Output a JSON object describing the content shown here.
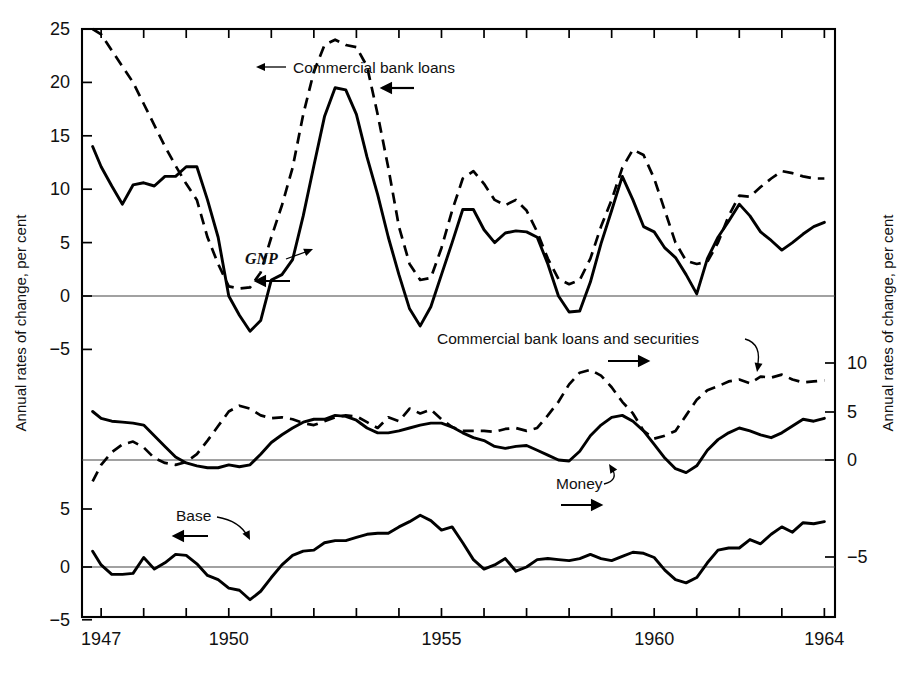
{
  "figure": {
    "left_axis_title": "Annual rates of change, per cent",
    "right_axis_title": "Annual rates of change, per cent"
  },
  "axes": {
    "left_top_ticks": [
      "25",
      "20",
      "15",
      "10",
      "5",
      "0",
      "-5"
    ],
    "left_middle_ticks": [
      "5"
    ],
    "left_bottom_ticks": [
      "5",
      "0",
      "-5"
    ],
    "right_ticks": [
      "10",
      "5",
      "0",
      "-5"
    ],
    "x_labels": [
      "1947",
      "1950",
      "1955",
      "1960",
      "1964"
    ]
  },
  "annotations": {
    "commercial_bank_loans": "Commercial bank loans",
    "gnp": "GNP",
    "commercial_bank_loans_and_securities": "Commercial bank loans and securities",
    "money": "Money",
    "base": "Base"
  },
  "chart_data": {
    "type": "line",
    "title": "",
    "xlabel": "",
    "ylabel": "Annual rates of change, per cent",
    "grid": false,
    "legend": "inline annotations with leader arrows",
    "panels": [
      {
        "name": "top",
        "ylim": [
          -5,
          25
        ],
        "yticks": [
          -5,
          0,
          5,
          10,
          15,
          20,
          25
        ],
        "axis_side": "left",
        "series": [
          {
            "name": "GNP",
            "style": "solid",
            "arrow": "left",
            "x": [
              1946.8,
              1947.0,
              1947.25,
              1947.5,
              1947.75,
              1948.0,
              1948.25,
              1948.5,
              1948.75,
              1949.0,
              1949.25,
              1949.5,
              1949.75,
              1950.0,
              1950.25,
              1950.5,
              1950.75,
              1951.0,
              1951.25,
              1951.5,
              1951.75,
              1952.0,
              1952.25,
              1952.5,
              1952.75,
              1953.0,
              1953.25,
              1953.5,
              1953.75,
              1954.0,
              1954.25,
              1954.5,
              1954.75,
              1955.0,
              1955.25,
              1955.5,
              1955.75,
              1956.0,
              1956.25,
              1956.5,
              1956.75,
              1957.0,
              1957.25,
              1957.5,
              1957.75,
              1958.0,
              1958.25,
              1958.5,
              1958.75,
              1959.0,
              1959.25,
              1959.5,
              1959.75,
              1960.0,
              1960.25,
              1960.5,
              1960.75,
              1961.0,
              1961.25,
              1961.5,
              1961.75,
              1962.0,
              1962.25,
              1962.5,
              1962.75,
              1963.0,
              1963.25,
              1963.5,
              1963.75,
              1964.0
            ],
            "y": [
              14.0,
              12.1,
              10.3,
              8.6,
              10.4,
              10.6,
              10.3,
              11.2,
              11.2,
              12.1,
              12.1,
              9.0,
              5.5,
              0.0,
              -1.8,
              -3.3,
              -2.3,
              1.5,
              2.0,
              3.4,
              7.5,
              12.2,
              16.8,
              19.5,
              19.3,
              17.0,
              13.0,
              9.5,
              5.5,
              2.0,
              -1.2,
              -2.8,
              -1.0,
              2.0,
              5.0,
              8.1,
              8.1,
              6.2,
              5.0,
              5.9,
              6.1,
              6.0,
              5.5,
              3.0,
              0.0,
              -1.5,
              -1.4,
              1.3,
              4.9,
              8.0,
              11.2,
              9.0,
              6.5,
              6.0,
              4.5,
              3.6,
              2.0,
              0.2,
              3.5,
              5.5,
              7.0,
              8.6,
              7.5,
              6.0,
              5.2,
              4.3,
              5.0,
              5.8,
              6.5,
              6.9
            ]
          },
          {
            "name": "Commercial bank loans",
            "style": "dashed",
            "arrow": "left",
            "x": [
              1946.8,
              1947.0,
              1947.25,
              1947.5,
              1947.75,
              1948.0,
              1948.25,
              1948.5,
              1948.75,
              1949.0,
              1949.25,
              1949.5,
              1949.75,
              1950.0,
              1950.25,
              1950.5,
              1950.75,
              1951.0,
              1951.25,
              1951.5,
              1951.75,
              1952.0,
              1952.25,
              1952.5,
              1952.75,
              1953.0,
              1953.25,
              1953.5,
              1953.75,
              1954.0,
              1954.25,
              1954.5,
              1954.75,
              1955.0,
              1955.25,
              1955.5,
              1955.75,
              1956.0,
              1956.25,
              1956.5,
              1956.75,
              1957.0,
              1957.25,
              1957.5,
              1957.75,
              1958.0,
              1958.25,
              1958.5,
              1958.75,
              1959.0,
              1959.25,
              1959.5,
              1959.75,
              1960.0,
              1960.25,
              1960.5,
              1960.75,
              1961.0,
              1961.25,
              1961.5,
              1961.75,
              1962.0,
              1962.25,
              1962.5,
              1962.75,
              1963.0,
              1963.25,
              1963.5,
              1963.75,
              1964.0
            ],
            "y": [
              25.0,
              24.5,
              23.0,
              21.5,
              20.0,
              18.0,
              16.0,
              14.0,
              12.2,
              10.5,
              9.0,
              5.5,
              3.0,
              0.9,
              0.7,
              0.8,
              2.2,
              5.5,
              8.5,
              12.0,
              17.0,
              21.0,
              23.5,
              24.0,
              23.5,
              23.3,
              21.5,
              17.0,
              12.0,
              6.5,
              3.0,
              1.5,
              1.7,
              4.5,
              8.0,
              11.0,
              11.7,
              10.5,
              9.0,
              8.5,
              9.0,
              8.0,
              6.0,
              3.5,
              1.6,
              1.1,
              1.5,
              3.5,
              6.5,
              9.0,
              12.0,
              13.7,
              13.2,
              11.0,
              8.0,
              5.0,
              3.3,
              3.0,
              3.2,
              5.0,
              7.5,
              9.4,
              9.3,
              10.2,
              11.0,
              11.7,
              11.5,
              11.2,
              11.0,
              11.0
            ]
          }
        ]
      },
      {
        "name": "middle",
        "ylim": [
          -3,
          12
        ],
        "yticks": [
          0,
          5,
          10
        ],
        "axis_side": "right",
        "series": [
          {
            "name": "Money",
            "style": "solid",
            "arrow": "right",
            "x": [
              1946.8,
              1947.0,
              1947.25,
              1947.5,
              1947.75,
              1948.0,
              1948.25,
              1948.5,
              1948.75,
              1949.0,
              1949.25,
              1949.5,
              1949.75,
              1950.0,
              1950.25,
              1950.5,
              1950.75,
              1951.0,
              1951.25,
              1951.5,
              1951.75,
              1952.0,
              1952.25,
              1952.5,
              1952.75,
              1953.0,
              1953.25,
              1953.5,
              1953.75,
              1954.0,
              1954.25,
              1954.5,
              1954.75,
              1955.0,
              1955.25,
              1955.5,
              1955.75,
              1956.0,
              1956.25,
              1956.5,
              1956.75,
              1957.0,
              1957.25,
              1957.5,
              1957.75,
              1958.0,
              1958.25,
              1958.5,
              1958.75,
              1959.0,
              1959.25,
              1959.5,
              1959.75,
              1960.0,
              1960.25,
              1960.5,
              1960.75,
              1961.0,
              1961.25,
              1961.5,
              1961.75,
              1962.0,
              1962.25,
              1962.5,
              1962.75,
              1963.0,
              1963.25,
              1963.5,
              1963.75,
              1964.0
            ],
            "y": [
              5.0,
              4.3,
              4.0,
              3.9,
              3.8,
              3.6,
              2.5,
              1.4,
              0.3,
              -0.3,
              -0.6,
              -0.8,
              -0.8,
              -0.5,
              -0.7,
              -0.5,
              0.6,
              1.8,
              2.6,
              3.3,
              3.9,
              4.2,
              4.2,
              4.6,
              4.5,
              4.1,
              3.3,
              2.8,
              2.8,
              3.0,
              3.3,
              3.6,
              3.8,
              3.8,
              3.4,
              2.8,
              2.3,
              2.0,
              1.4,
              1.2,
              1.4,
              1.5,
              1.0,
              0.5,
              0.0,
              -0.1,
              0.9,
              2.5,
              3.6,
              4.4,
              4.6,
              4.0,
              3.0,
              1.6,
              0.2,
              -0.9,
              -1.3,
              -0.6,
              1.0,
              2.1,
              2.8,
              3.3,
              3.0,
              2.6,
              2.3,
              2.8,
              3.5,
              4.2,
              4.0,
              4.3
            ]
          },
          {
            "name": "Commercial bank loans and securities",
            "style": "dashed",
            "arrow": "right",
            "x": [
              1946.8,
              1947.0,
              1947.25,
              1947.5,
              1947.75,
              1948.0,
              1948.25,
              1948.5,
              1948.75,
              1949.0,
              1949.25,
              1949.5,
              1949.75,
              1950.0,
              1950.25,
              1950.5,
              1950.75,
              1951.0,
              1951.25,
              1951.5,
              1951.75,
              1952.0,
              1952.25,
              1952.5,
              1952.75,
              1953.0,
              1953.25,
              1953.5,
              1953.75,
              1954.0,
              1954.25,
              1954.5,
              1954.75,
              1955.0,
              1955.25,
              1955.5,
              1955.75,
              1956.0,
              1956.25,
              1956.5,
              1956.75,
              1957.0,
              1957.25,
              1957.5,
              1957.75,
              1958.0,
              1958.25,
              1958.5,
              1958.75,
              1959.0,
              1959.25,
              1959.5,
              1959.75,
              1960.0,
              1960.25,
              1960.5,
              1960.75,
              1961.0,
              1961.25,
              1961.5,
              1961.75,
              1962.0,
              1962.25,
              1962.5,
              1962.75,
              1963.0,
              1963.25,
              1963.5,
              1963.75,
              1964.0
            ],
            "y": [
              -2.2,
              -0.5,
              0.8,
              1.6,
              1.9,
              1.3,
              0.2,
              -0.3,
              -0.5,
              -0.2,
              0.6,
              2.0,
              3.5,
              5.0,
              5.6,
              5.3,
              4.6,
              4.3,
              4.4,
              4.2,
              3.8,
              3.6,
              4.0,
              4.4,
              4.6,
              4.5,
              3.9,
              3.3,
              4.4,
              4.0,
              5.3,
              4.8,
              5.2,
              4.2,
              3.4,
              3.0,
              3.0,
              3.0,
              2.9,
              3.2,
              3.3,
              3.0,
              3.3,
              4.6,
              6.0,
              7.8,
              9.0,
              9.3,
              8.7,
              7.5,
              6.0,
              4.8,
              3.0,
              2.2,
              2.5,
              3.0,
              4.6,
              6.2,
              7.2,
              7.6,
              8.1,
              8.3,
              7.9,
              8.6,
              8.5,
              8.8,
              8.3,
              8.0,
              8.1,
              8.2
            ]
          }
        ]
      },
      {
        "name": "bottom",
        "ylim": [
          -5,
          6
        ],
        "yticks": [
          -5,
          0,
          5
        ],
        "axis_side": "left",
        "series": [
          {
            "name": "Base",
            "style": "solid",
            "arrow": "left",
            "x": [
              1946.8,
              1947.0,
              1947.25,
              1947.5,
              1947.75,
              1948.0,
              1948.25,
              1948.5,
              1948.75,
              1949.0,
              1949.25,
              1949.5,
              1949.75,
              1950.0,
              1950.25,
              1950.5,
              1950.75,
              1951.0,
              1951.25,
              1951.5,
              1951.75,
              1952.0,
              1952.25,
              1952.5,
              1952.75,
              1953.0,
              1953.25,
              1953.5,
              1953.75,
              1954.0,
              1954.25,
              1954.5,
              1954.75,
              1955.0,
              1955.25,
              1955.5,
              1955.75,
              1956.0,
              1956.25,
              1956.5,
              1956.75,
              1957.0,
              1957.25,
              1957.5,
              1957.75,
              1958.0,
              1958.25,
              1958.5,
              1958.75,
              1959.0,
              1959.25,
              1959.5,
              1959.75,
              1960.0,
              1960.25,
              1960.5,
              1960.75,
              1961.0,
              1961.25,
              1961.5,
              1961.75,
              1962.0,
              1962.25,
              1962.5,
              1962.75,
              1963.0,
              1963.25,
              1963.5,
              1963.75,
              1964.0
            ],
            "y": [
              1.5,
              0.2,
              -0.7,
              -0.7,
              -0.6,
              0.9,
              -0.2,
              0.4,
              1.2,
              1.1,
              0.3,
              -0.8,
              -1.2,
              -2.0,
              -2.2,
              -3.1,
              -2.3,
              -1.0,
              0.2,
              1.1,
              1.5,
              1.6,
              2.3,
              2.5,
              2.5,
              2.8,
              3.1,
              3.2,
              3.2,
              3.8,
              4.3,
              4.9,
              4.4,
              3.5,
              3.8,
              2.3,
              0.7,
              -0.2,
              0.2,
              0.8,
              -0.4,
              0.0,
              0.7,
              0.8,
              0.7,
              0.6,
              0.8,
              1.2,
              0.8,
              0.6,
              1.0,
              1.4,
              1.3,
              0.9,
              -0.3,
              -1.2,
              -1.5,
              -1.0,
              0.4,
              1.6,
              1.8,
              1.8,
              2.6,
              2.2,
              3.1,
              3.8,
              3.3,
              4.2,
              4.1,
              4.3
            ]
          }
        ]
      }
    ]
  }
}
